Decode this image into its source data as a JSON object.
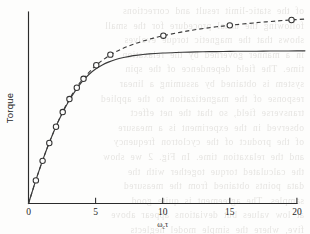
{
  "figure": {
    "background_color": "#fdfdfc",
    "ink_color": "#333333",
    "ylabel": "Torque",
    "xlabel_main": "ω",
    "xlabel_sub": "c",
    "xlabel_tail": "τ"
  },
  "chart_data": {
    "type": "line",
    "title": "",
    "subtitle": "",
    "xlabel": "ωcτ",
    "ylabel": "Torque",
    "xlim": [
      0,
      20.6
    ],
    "ylim": [
      0,
      1.06
    ],
    "grid": false,
    "legend": "none",
    "xticks": [
      0,
      5,
      10,
      15,
      20
    ],
    "xtick_labels": [
      "0",
      "5",
      "10",
      "15",
      "20"
    ],
    "yticks": [],
    "ytick_labels": [],
    "annotations": [],
    "series": [
      {
        "name": "saturating-theory-curve",
        "style": "solid",
        "marker": "none",
        "x": [
          0.0,
          0.25,
          0.5,
          0.75,
          1.0,
          1.25,
          1.5,
          1.75,
          2.0,
          2.25,
          2.5,
          2.75,
          3.0,
          3.25,
          3.5,
          3.75,
          4.0,
          4.5,
          5.0,
          5.5,
          6.0,
          6.5,
          7.0,
          7.5,
          8.0,
          9.0,
          10.0,
          11.0,
          12.0,
          13.0,
          14.0,
          15.0,
          16.0,
          17.0,
          18.0,
          19.0,
          20.0,
          20.6
        ],
        "y": [
          0.0,
          0.059,
          0.118,
          0.174,
          0.228,
          0.279,
          0.328,
          0.374,
          0.418,
          0.459,
          0.497,
          0.533,
          0.566,
          0.597,
          0.625,
          0.651,
          0.675,
          0.714,
          0.744,
          0.767,
          0.784,
          0.797,
          0.807,
          0.814,
          0.82,
          0.828,
          0.833,
          0.836,
          0.838,
          0.84,
          0.841,
          0.842,
          0.843,
          0.843,
          0.844,
          0.844,
          0.845,
          0.845
        ]
      },
      {
        "name": "experimental-data-curve",
        "style": "dashed",
        "marker": "open-circle",
        "x": [
          0.0,
          0.5,
          1.0,
          1.5,
          2.0,
          2.5,
          3.0,
          3.5,
          4.0,
          5.0,
          6.0,
          7.0,
          8.0,
          9.0,
          10.0,
          12.0,
          14.0,
          15.0,
          17.0,
          19.0,
          20.0,
          20.6
        ],
        "y": [
          0.0,
          0.118,
          0.228,
          0.328,
          0.418,
          0.5,
          0.572,
          0.632,
          0.684,
          0.762,
          0.818,
          0.857,
          0.886,
          0.909,
          0.928,
          0.957,
          0.978,
          0.986,
          1.001,
          1.013,
          1.018,
          1.021
        ],
        "markers_x": [
          0.55,
          1.05,
          1.55,
          2.05,
          2.55,
          3.05,
          3.6,
          4.1,
          5.05,
          6.1,
          10.05,
          15.0,
          19.6
        ],
        "markers_y": [
          0.128,
          0.236,
          0.335,
          0.425,
          0.506,
          0.578,
          0.641,
          0.69,
          0.765,
          0.824,
          0.929,
          0.986,
          1.016
        ]
      }
    ]
  },
  "bleed_text": {
    "lines": [
      "of the static-limit result and corrections",
      "following the usual procedure for the small",
      "shows that the magnetic torque evolves",
      "in a manner governed by the relaxation",
      "time. The field dependence of the spin",
      "system is obtained by assuming a linear",
      "response of the magnetization to the applied",
      "transverse field, so that the net effect",
      "observed in the experiment is a measure",
      "of the product of the cyclotron frequency",
      "and the relaxation time. In Fig. 2 we show",
      "the calculated torque together with the",
      "data points obtained from the measured",
      "samples. The agreement is quite good",
      "at low values but deviations appear above",
      "five, where the simple model neglects",
      "scattering terms of higher order in the",
      "field. These results show that the simple",
      "relaxation picture is adequate only in the",
      "limit of small cyclotron frequencies and",
      "that the additional contributions are not",
      "negligible in the high-field regime."
    ]
  }
}
